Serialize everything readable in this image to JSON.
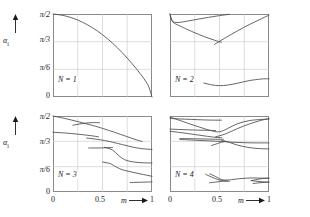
{
  "figure": {
    "axis_y_name": "α",
    "axis_y_sub": "i",
    "axis_x_name": "m",
    "y_ticks": [
      "π/2",
      "π/3",
      "π/6",
      "0"
    ],
    "y_tick_values": [
      1.5708,
      1.0472,
      0.5236,
      0
    ],
    "x_ticks": [
      "0",
      "0.5",
      "1"
    ],
    "x_tick_values": [
      0,
      0.5,
      1
    ]
  },
  "chart_data": {
    "type": "line",
    "title": "",
    "xlabel": "m",
    "ylabel": "alpha_i",
    "xlim": [
      0,
      1
    ],
    "ylim": [
      0,
      1.5708
    ],
    "grid": true,
    "legend": "none",
    "panels": [
      {
        "label": "N = 1",
        "n": 1,
        "position": "top-left",
        "series": [
          {
            "name": "branch-1",
            "x": [
              0,
              0.1,
              0.2,
              0.3,
              0.4,
              0.5,
              0.6,
              0.7,
              0.8,
              0.88,
              0.94,
              0.97,
              1.0
            ],
            "y": [
              1.5708,
              1.5446,
              1.4923,
              1.4137,
              1.309,
              1.1781,
              1.021,
              0.8378,
              0.6283,
              0.445,
              0.288,
              0.18,
              0.0
            ]
          }
        ]
      },
      {
        "label": "N = 2",
        "n": 2,
        "position": "top-right",
        "series": [
          {
            "name": "branch-1",
            "x": [
              0.0,
              0.02,
              0.08,
              0.2,
              0.35,
              0.5,
              0.6
            ],
            "y": [
              1.5708,
              1.44,
              1.41,
              1.445,
              1.495,
              1.54,
              1.565
            ]
          },
          {
            "name": "branch-2",
            "x": [
              0.0,
              0.03,
              0.1,
              0.22,
              0.35,
              0.45,
              0.52
            ],
            "y": [
              1.5708,
              1.42,
              1.345,
              1.24,
              1.14,
              1.075,
              1.035
            ]
          },
          {
            "name": "branch-3",
            "x": [
              0.45,
              0.55,
              0.68,
              0.8,
              0.9,
              1.0
            ],
            "y": [
              0.995,
              1.11,
              1.25,
              1.37,
              1.46,
              1.55
            ]
          },
          {
            "name": "branch-4",
            "x": [
              0.34,
              0.42,
              0.5,
              0.58,
              0.68,
              0.8,
              0.92,
              1.0
            ],
            "y": [
              0.265,
              0.23,
              0.215,
              0.225,
              0.26,
              0.31,
              0.34,
              0.345
            ]
          }
        ]
      },
      {
        "label": "N = 3",
        "n": 3,
        "position": "bottom-left",
        "series": [
          {
            "name": "branch-1",
            "x": [
              0.0,
              0.12,
              0.26,
              0.4,
              0.5,
              0.62,
              0.74,
              0.84,
              0.9
            ],
            "y": [
              1.5708,
              1.52,
              1.45,
              1.375,
              1.315,
              1.235,
              1.15,
              1.08,
              1.045
            ]
          },
          {
            "name": "branch-2",
            "x": [
              0.2,
              0.3,
              0.4,
              0.47
            ],
            "y": [
              1.38,
              1.415,
              1.435,
              1.43
            ]
          },
          {
            "name": "branch-3",
            "x": [
              0.0,
              0.12,
              0.25,
              0.38,
              0.46
            ],
            "y": [
              1.235,
              1.22,
              1.195,
              1.165,
              1.14
            ]
          },
          {
            "name": "branch-4",
            "x": [
              0.34,
              0.44,
              0.52,
              0.6,
              0.7,
              0.8,
              0.9,
              1.0
            ],
            "y": [
              1.115,
              1.09,
              1.065,
              1.03,
              0.98,
              0.93,
              0.895,
              0.88
            ]
          },
          {
            "name": "branch-5",
            "x": [
              0.36,
              0.46,
              0.54,
              0.6
            ],
            "y": [
              0.91,
              0.91,
              0.915,
              0.92
            ]
          },
          {
            "name": "branch-6",
            "x": [
              0.52,
              0.6,
              0.66,
              0.72,
              0.8,
              0.9,
              1.0
            ],
            "y": [
              0.925,
              0.87,
              0.76,
              0.67,
              0.625,
              0.605,
              0.6
            ]
          },
          {
            "name": "branch-7",
            "x": [
              0.5,
              0.58,
              0.64,
              0.7,
              0.78,
              0.88,
              1.0
            ],
            "y": [
              0.62,
              0.585,
              0.515,
              0.46,
              0.42,
              0.375,
              0.325
            ]
          },
          {
            "name": "branch-8",
            "x": [
              0.78,
              0.86,
              0.94,
              1.0
            ],
            "y": [
              0.195,
              0.2,
              0.205,
              0.21
            ]
          }
        ]
      },
      {
        "label": "N = 4",
        "n": 4,
        "position": "bottom-right",
        "series": [
          {
            "name": "branch-1",
            "x": [
              0.0,
              0.1,
              0.22,
              0.34,
              0.44,
              0.52
            ],
            "y": [
              1.52,
              1.51,
              1.5,
              1.49,
              1.485,
              1.485
            ]
          },
          {
            "name": "branch-2",
            "x": [
              0.0,
              0.14,
              0.3,
              0.42,
              0.5,
              0.58,
              0.68,
              0.8,
              0.92,
              1.0
            ],
            "y": [
              1.55,
              1.45,
              1.34,
              1.265,
              1.245,
              1.31,
              1.41,
              1.475,
              1.5,
              1.505
            ]
          },
          {
            "name": "branch-3",
            "x": [
              0.0,
              0.12,
              0.26,
              0.38,
              0.46
            ],
            "y": [
              1.3,
              1.29,
              1.28,
              1.275,
              1.27
            ]
          },
          {
            "name": "branch-4",
            "x": [
              0.0,
              0.12,
              0.26,
              0.38,
              0.46,
              0.52
            ],
            "y": [
              1.255,
              1.225,
              1.185,
              1.15,
              1.13,
              1.125
            ]
          },
          {
            "name": "branch-5",
            "x": [
              0.46,
              0.56,
              0.68,
              0.8,
              0.9,
              1.0
            ],
            "y": [
              1.14,
              1.2,
              1.31,
              1.405,
              1.47,
              1.52
            ]
          },
          {
            "name": "branch-6",
            "x": [
              0.1,
              0.24,
              0.36,
              0.46,
              0.54
            ],
            "y": [
              1.105,
              1.1,
              1.095,
              1.09,
              1.09
            ]
          },
          {
            "name": "branch-7",
            "x": [
              0.1,
              0.26,
              0.4,
              0.52,
              0.62,
              0.74,
              0.86,
              1.0
            ],
            "y": [
              1.085,
              1.07,
              1.055,
              1.045,
              1.03,
              1.02,
              1.015,
              1.015
            ]
          },
          {
            "name": "branch-8",
            "x": [
              0.52,
              0.6,
              0.68,
              0.78,
              0.88,
              1.0
            ],
            "y": [
              1.07,
              1.025,
              0.97,
              0.925,
              0.9,
              0.89
            ]
          },
          {
            "name": "branch-9",
            "x": [
              0.42,
              0.5,
              0.56
            ],
            "y": [
              0.96,
              1.015,
              1.05
            ]
          },
          {
            "name": "branch-10",
            "x": [
              0.4,
              0.46,
              0.5,
              0.54,
              0.6,
              0.7,
              0.82,
              0.94,
              1.0
            ],
            "y": [
              0.375,
              0.32,
              0.275,
              0.25,
              0.25,
              0.275,
              0.29,
              0.285,
              0.28
            ]
          },
          {
            "name": "branch-11",
            "x": [
              0.36,
              0.42,
              0.48,
              0.54,
              0.6
            ],
            "y": [
              0.365,
              0.31,
              0.26,
              0.23,
              0.22
            ]
          },
          {
            "name": "branch-12",
            "x": [
              0.4,
              0.46,
              0.52,
              0.58
            ],
            "y": [
              0.19,
              0.205,
              0.22,
              0.23
            ]
          },
          {
            "name": "branch-13",
            "x": [
              0.82,
              0.88,
              0.94,
              1.0
            ],
            "y": [
              0.235,
              0.26,
              0.28,
              0.29
            ]
          },
          {
            "name": "branch-14",
            "x": [
              0.82,
              0.88,
              0.94,
              1.0
            ],
            "y": [
              0.235,
              0.22,
              0.21,
              0.205
            ]
          },
          {
            "name": "branch-15",
            "x": [
              0.84,
              0.9,
              0.96,
              1.0
            ],
            "y": [
              0.175,
              0.19,
              0.2,
              0.205
            ]
          }
        ]
      }
    ]
  }
}
